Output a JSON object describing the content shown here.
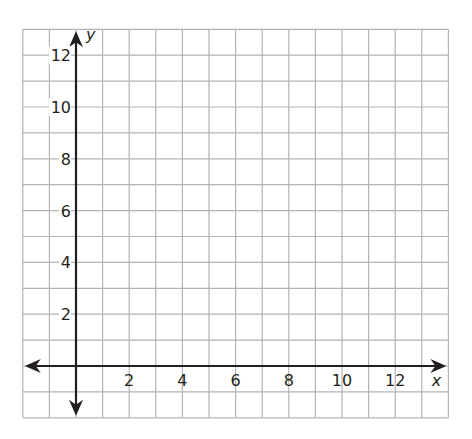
{
  "chart_data": {
    "type": "scatter",
    "title": "",
    "xlabel": "x",
    "ylabel": "y",
    "xlim": [
      -2,
      14
    ],
    "ylim": [
      -2,
      13
    ],
    "grid": true,
    "grid_step": 1,
    "x_ticks": [
      2,
      4,
      6,
      8,
      10,
      12
    ],
    "x_tick_labels": [
      "2",
      "4",
      "6",
      "8",
      "10",
      "12"
    ],
    "y_ticks": [
      2,
      4,
      6,
      8,
      10,
      12
    ],
    "y_tick_labels": [
      "2",
      "4",
      "6",
      "8",
      "10",
      "12"
    ],
    "series": [],
    "legend": null
  },
  "colors": {
    "grid": "#b3b3b3",
    "axis": "#231f20",
    "background": "#ffffff"
  },
  "layout": {
    "origin_px": [
      76,
      366
    ],
    "unit_x_px": 26.6,
    "unit_y_px": 25.9
  }
}
